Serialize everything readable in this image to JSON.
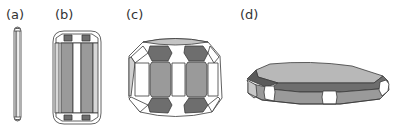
{
  "figure": {
    "panels": [
      {
        "id": "a",
        "label": "(a)",
        "description": "thin elongated needle-like prism"
      },
      {
        "id": "b",
        "label": "(b)",
        "description": "columnar prism with rounded ends"
      },
      {
        "id": "c",
        "label": "(c)",
        "description": "equant polyhedron with many facets"
      },
      {
        "id": "d",
        "label": "(d)",
        "description": "flat tabular plate"
      }
    ],
    "colors": {
      "dark_face": "#6e6e6e",
      "mid_face": "#9a9a9a",
      "light_face": "#c4c4c4",
      "top_face": "#b8b8b8",
      "white_face": "#ffffff",
      "outline": "#3a3a3a"
    }
  }
}
